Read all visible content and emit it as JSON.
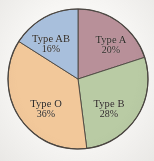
{
  "chart_data": {
    "type": "pie",
    "title": "",
    "subtitle": "",
    "xlabel": "",
    "ylabel": "",
    "legend_position": "none",
    "labels_inside_slices": true,
    "start_angle_deg": 0,
    "direction": "clockwise",
    "categories": [
      "Type A",
      "Type B",
      "Type O",
      "Type AB"
    ],
    "values": [
      20,
      28,
      36,
      16
    ],
    "value_unit": "%",
    "value_labels": [
      "20%",
      "28%",
      "36%",
      "16%"
    ],
    "colors": [
      "#b89099",
      "#b9cba4",
      "#f2c89a",
      "#a8bfdc"
    ],
    "slices": [
      {
        "label": "Type A",
        "value": 20,
        "value_label": "20%",
        "color": "#b89099",
        "start_deg": 0,
        "end_deg": 72
      },
      {
        "label": "Type B",
        "value": 28,
        "value_label": "28%",
        "color": "#b9cba4",
        "start_deg": 72,
        "end_deg": 172.8
      },
      {
        "label": "Type O",
        "value": 36,
        "value_label": "36%",
        "color": "#f2c89a",
        "start_deg": 172.8,
        "end_deg": 302.4
      },
      {
        "label": "Type AB",
        "value": 16,
        "value_label": "16%",
        "color": "#a8bfdc",
        "start_deg": 302.4,
        "end_deg": 360
      }
    ],
    "total": 100,
    "grid": false,
    "outline_color": "#4a4540",
    "background_color": "#f7f6f4",
    "text_color": "#2b2724"
  }
}
